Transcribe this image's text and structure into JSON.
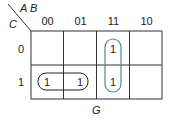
{
  "kmap": {
    "var_cols": "A B",
    "var_rows": "C",
    "col_labels": [
      "00",
      "01",
      "11",
      "10"
    ],
    "row_labels": [
      "0",
      "1"
    ],
    "cells": [
      [
        "",
        "",
        "1",
        ""
      ],
      [
        "1",
        "1",
        "1",
        ""
      ]
    ],
    "caption": "G",
    "groups": [
      {
        "cells": [
          [
            1,
            0
          ],
          [
            1,
            1
          ]
        ],
        "color": "#222222"
      },
      {
        "cells": [
          [
            0,
            2
          ],
          [
            1,
            2
          ]
        ],
        "color": "#4a8c8c"
      }
    ]
  }
}
